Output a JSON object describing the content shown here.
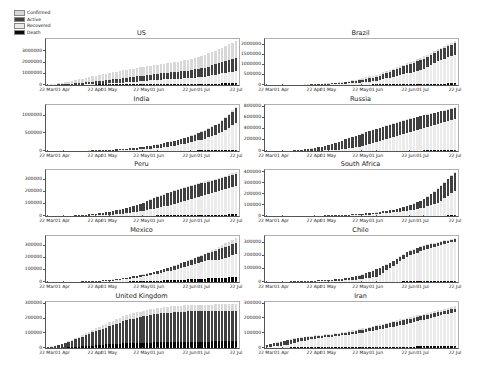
{
  "figure": {
    "background": "#ffffff"
  },
  "legend": {
    "position": "upper-left",
    "items": [
      {
        "label": "Confirmed",
        "color": "#d8d8d8"
      },
      {
        "label": "Active",
        "color": "#404040"
      },
      {
        "label": "Recovered",
        "color": "#ebebeb"
      },
      {
        "label": "Death",
        "color": "#0a0a0a"
      }
    ]
  },
  "x_axis": {
    "tick_labels": [
      "22 Mar",
      "01 Apr",
      "22 Apr",
      "01 May",
      "22 May",
      "01 Jun",
      "22 Jun",
      "01 Jul",
      "22 Jul"
    ],
    "tick_fractions": [
      0,
      0.082,
      0.254,
      0.328,
      0.5,
      0.582,
      0.754,
      0.828,
      1.0
    ]
  },
  "sample_dates": [
    "22 Mar",
    "01 Apr",
    "11 Apr",
    "21 Apr",
    "01 May",
    "11 May",
    "21 May",
    "01 Jun",
    "11 Jun",
    "21 Jun",
    "01 Jul",
    "11 Jul",
    "22 Jul"
  ],
  "chart_data": [
    {
      "type": "bar",
      "title": "US",
      "ylim": [
        0,
        4100000
      ],
      "yticks": [
        0,
        1000000,
        2000000,
        3000000
      ],
      "grid": false,
      "series": [
        {
          "name": "Confirmed",
          "values": [
            34000,
            213000,
            526000,
            823000,
            1100000,
            1350000,
            1600000,
            1810000,
            2020000,
            2280000,
            2680000,
            3240000,
            3900000
          ]
        },
        {
          "name": "Recovered",
          "values": [
            1000,
            9000,
            32000,
            76000,
            154000,
            232000,
            350000,
            458000,
            540000,
            617000,
            729000,
            1006000,
            1210000
          ]
        },
        {
          "name": "Active",
          "values": [
            10000,
            64000,
            158000,
            247000,
            330000,
            405000,
            480000,
            543000,
            606000,
            684000,
            804000,
            972000,
            1170000
          ]
        },
        {
          "name": "Death",
          "values": [
            500,
            5000,
            21000,
            45000,
            65000,
            80000,
            95000,
            106000,
            113000,
            120000,
            128000,
            135000,
            142000
          ]
        }
      ]
    },
    {
      "type": "bar",
      "title": "Brazil",
      "ylim": [
        0,
        2270000
      ],
      "yticks": [
        0,
        500000,
        1000000,
        1500000,
        2000000
      ],
      "grid": false,
      "series": [
        {
          "name": "Confirmed",
          "values": [
            1600,
            6800,
            21000,
            43000,
            92000,
            169000,
            310000,
            514000,
            775000,
            1086000,
            1402000,
            1800000,
            2160000
          ]
        },
        {
          "name": "Recovered",
          "values": [
            100,
            200,
            2000,
            17000,
            38000,
            67000,
            125000,
            206000,
            396000,
            580000,
            790000,
            1200000,
            1500000
          ]
        },
        {
          "name": "Active",
          "values": [
            500,
            2000,
            8000,
            17000,
            36000,
            67000,
            120000,
            200000,
            300000,
            420000,
            500000,
            530000,
            570000
          ]
        },
        {
          "name": "Death",
          "values": [
            30,
            240,
            1100,
            2700,
            6400,
            11600,
            20000,
            29000,
            39000,
            50000,
            59000,
            70000,
            81000
          ]
        }
      ]
    },
    {
      "type": "bar",
      "title": "India",
      "ylim": [
        0,
        1300000
      ],
      "yticks": [
        0,
        500000,
        1000000
      ],
      "grid": false,
      "series": [
        {
          "name": "Confirmed",
          "values": [
            400,
            1600,
            8400,
            20000,
            35000,
            67000,
            112000,
            190000,
            286000,
            410000,
            585000,
            820000,
            1240000
          ]
        },
        {
          "name": "Recovered",
          "values": [
            20,
            150,
            800,
            4000,
            9000,
            21000,
            46000,
            82000,
            141000,
            227000,
            347000,
            515000,
            780000
          ]
        },
        {
          "name": "Active",
          "values": [
            300,
            1300,
            7000,
            15000,
            25000,
            44000,
            63000,
            97000,
            137000,
            169000,
            220000,
            280000,
            426000
          ]
        },
        {
          "name": "Death",
          "values": [
            10,
            40,
            280,
            650,
            1100,
            2200,
            3400,
            5400,
            8100,
            13000,
            17000,
            22000,
            30000
          ]
        }
      ]
    },
    {
      "type": "bar",
      "title": "Russia",
      "ylim": [
        0,
        830000
      ],
      "yticks": [
        0,
        200000,
        400000,
        600000,
        800000
      ],
      "grid": false,
      "series": [
        {
          "name": "Confirmed",
          "values": [
            370,
            2300,
            13600,
            52000,
            106000,
            209000,
            308000,
            405000,
            493000,
            576000,
            647000,
            713000,
            790000
          ]
        },
        {
          "name": "Recovered",
          "values": [
            20,
            120,
            1000,
            3900,
            11600,
            34000,
            85000,
            171000,
            252000,
            332000,
            412000,
            489000,
            572000
          ]
        },
        {
          "name": "Active",
          "values": [
            300,
            2000,
            12000,
            47000,
            93000,
            172000,
            218000,
            228000,
            234000,
            237000,
            227000,
            215000,
            205000
          ]
        },
        {
          "name": "Death",
          "values": [
            0,
            20,
            100,
            460,
            1100,
            1900,
            2900,
            4700,
            6400,
            8000,
            9300,
            11000,
            12800
          ]
        }
      ]
    },
    {
      "type": "bar",
      "title": "Peru",
      "ylim": [
        0,
        380000
      ],
      "yticks": [
        0,
        100000,
        200000,
        300000
      ],
      "grid": false,
      "series": [
        {
          "name": "Confirmed",
          "values": [
            360,
            1300,
            6800,
            17800,
            36900,
            67300,
            104000,
            164000,
            208000,
            251000,
            285000,
            319000,
            362000
          ]
        },
        {
          "name": "Recovered",
          "values": [
            0,
            400,
            1700,
            5500,
            10400,
            21300,
            42200,
            67200,
            98000,
            131000,
            174000,
            210000,
            250000
          ]
        },
        {
          "name": "Active",
          "values": [
            300,
            900,
            5000,
            12000,
            26000,
            44000,
            59000,
            92000,
            104000,
            112000,
            101000,
            99000,
            98000
          ]
        },
        {
          "name": "Death",
          "values": [
            0,
            30,
            180,
            480,
            1050,
            1900,
            3000,
            4500,
            5900,
            8000,
            9800,
            11700,
            13600
          ]
        }
      ]
    },
    {
      "type": "bar",
      "title": "South Africa",
      "ylim": [
        0,
        420000
      ],
      "yticks": [
        0,
        100000,
        200000,
        300000,
        400000
      ],
      "grid": false,
      "series": [
        {
          "name": "Confirmed",
          "values": [
            270,
            1400,
            2000,
            3500,
            5600,
            10000,
            19100,
            32700,
            55400,
            92700,
            151000,
            264000,
            400000
          ]
        },
        {
          "name": "Recovered",
          "values": [
            0,
            50,
            400,
            1100,
            2100,
            4400,
            8900,
            16800,
            31700,
            50300,
            73500,
            127000,
            230000
          ]
        },
        {
          "name": "Active",
          "values": [
            200,
            1200,
            1500,
            2300,
            3400,
            5500,
            10000,
            15500,
            22500,
            40000,
            74000,
            130000,
            164000
          ]
        },
        {
          "name": "Death",
          "values": [
            0,
            5,
            25,
            65,
            100,
            200,
            400,
            700,
            1200,
            1800,
            2700,
            3900,
            6000
          ]
        }
      ]
    },
    {
      "type": "bar",
      "title": "Mexico",
      "ylim": [
        0,
        380000
      ],
      "yticks": [
        0,
        100000,
        200000,
        300000
      ],
      "grid": false,
      "series": [
        {
          "name": "Confirmed",
          "values": [
            250,
            1200,
            4200,
            8800,
            19200,
            36000,
            59500,
            93400,
            133500,
            180500,
            231800,
            295300,
            362000
          ]
        },
        {
          "name": "Recovered",
          "values": [
            0,
            40,
            1800,
            5300,
            13400,
            23100,
            43400,
            67900,
            97700,
            134700,
            177100,
            184800,
            230000
          ]
        },
        {
          "name": "Active",
          "values": [
            200,
            1000,
            2200,
            3000,
            5000,
            12000,
            15000,
            24000,
            33000,
            42000,
            50000,
            90000,
            90000
          ]
        },
        {
          "name": "Death",
          "values": [
            0,
            30,
            270,
            750,
            1860,
            3600,
            6500,
            10200,
            16000,
            21800,
            28500,
            34700,
            41000
          ]
        }
      ]
    },
    {
      "type": "bar",
      "title": "Chile",
      "ylim": [
        0,
        352000
      ],
      "yticks": [
        0,
        100000,
        200000,
        300000
      ],
      "grid": false,
      "series": [
        {
          "name": "Confirmed",
          "values": [
            630,
            2700,
            6500,
            10800,
            16000,
            28900,
            53600,
            99700,
            154000,
            236700,
            282000,
            309300,
            335000
          ]
        },
        {
          "name": "Recovered",
          "values": [
            0,
            160,
            1300,
            4700,
            8100,
            12200,
            22500,
            41000,
            117000,
            196000,
            245000,
            278000,
            310000
          ]
        },
        {
          "name": "Active",
          "values": [
            500,
            2400,
            5000,
            5800,
            7500,
            16000,
            30000,
            56000,
            35000,
            36000,
            31000,
            25000,
            16000
          ]
        },
        {
          "name": "Death",
          "values": [
            0,
            10,
            60,
            140,
            230,
            310,
            540,
            1100,
            2600,
            4500,
            5800,
            6900,
            8700
          ]
        }
      ]
    },
    {
      "type": "bar",
      "title": "United Kingdom",
      "ylim": [
        0,
        312000
      ],
      "yticks": [
        0,
        100000,
        200000,
        300000
      ],
      "grid": false,
      "series": [
        {
          "name": "Confirmed",
          "values": [
            5700,
            30000,
            79000,
            130000,
            177000,
            224000,
            250000,
            272000,
            284000,
            291000,
            294000,
            296000,
            298000
          ]
        },
        {
          "name": "Recovered",
          "values": [
            70,
            140,
            300,
            600,
            900,
            1000,
            1100,
            1200,
            1300,
            1300,
            1300,
            1400,
            1400
          ]
        },
        {
          "name": "Active",
          "values": [
            5300,
            27600,
            69000,
            112000,
            149000,
            187000,
            213000,
            231000,
            241000,
            247000,
            249000,
            250000,
            251000
          ]
        },
        {
          "name": "Death",
          "values": [
            280,
            2400,
            9900,
            17300,
            26800,
            32100,
            36000,
            38500,
            41200,
            42600,
            43700,
            44800,
            45400
          ]
        }
      ]
    },
    {
      "type": "bar",
      "title": "Iran",
      "ylim": [
        0,
        310000
      ],
      "yticks": [
        0,
        100000,
        200000,
        300000
      ],
      "grid": false,
      "series": [
        {
          "name": "Confirmed",
          "values": [
            21600,
            47600,
            70000,
            84800,
            94600,
            109300,
            129300,
            154400,
            180200,
            204900,
            230200,
            255100,
            280000
          ]
        },
        {
          "name": "Recovered",
          "values": [
            7900,
            15500,
            41900,
            60900,
            75100,
            87400,
            100600,
            121000,
            142700,
            163600,
            191000,
            217700,
            243500
          ]
        },
        {
          "name": "Active",
          "values": [
            12000,
            29000,
            24000,
            18500,
            13500,
            15000,
            21000,
            25000,
            28000,
            31000,
            28000,
            24000,
            22000
          ]
        },
        {
          "name": "Death",
          "values": [
            1700,
            3000,
            4500,
            5300,
            6100,
            6700,
            7200,
            7900,
            8600,
            9600,
            10800,
            12600,
            14600
          ]
        }
      ]
    }
  ]
}
